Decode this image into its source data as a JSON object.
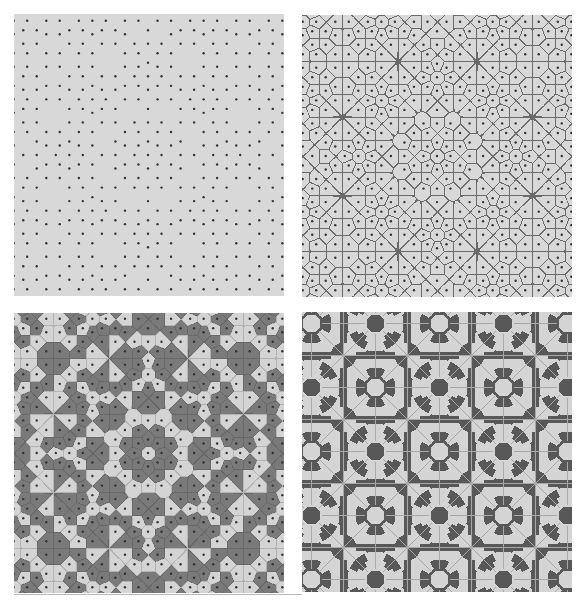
{
  "figure": {
    "panels": [
      {
        "id": "p1",
        "name": "quasicrystal-point-set",
        "style": "points",
        "x": 14,
        "y": 14,
        "width": 270,
        "height": 282,
        "center": [
          148,
          155
        ]
      },
      {
        "id": "p2",
        "name": "voronoi-tessellation",
        "style": "voronoi",
        "x": 302,
        "y": 15,
        "width": 270,
        "height": 282,
        "center": [
          437,
          156
        ]
      },
      {
        "id": "p3",
        "name": "two-color-quasiperiodic-voronoi",
        "style": "voronoi-colored",
        "x": 14,
        "y": 313,
        "width": 270,
        "height": 280,
        "center": [
          148,
          453
        ]
      },
      {
        "id": "p4",
        "name": "periodic-approximant-tiling",
        "style": "periodic",
        "x": 302,
        "y": 312,
        "width": 270,
        "height": 280,
        "period": 64,
        "grid_origin": [
          343,
          355
        ]
      }
    ],
    "lattice": {
      "symmetry": 8,
      "edge_length": 13.5,
      "window_scale": 1.0
    },
    "colors": {
      "background": "#d8d8d8",
      "dot": "#333333",
      "edge": "#6a6a6a",
      "light_cell": "#d4d4d4",
      "dark_cell": "#7a7a7a",
      "dark_periodic": "#585858",
      "thin_line": "#a8a8a8"
    }
  },
  "caption": {
    "text": ""
  }
}
